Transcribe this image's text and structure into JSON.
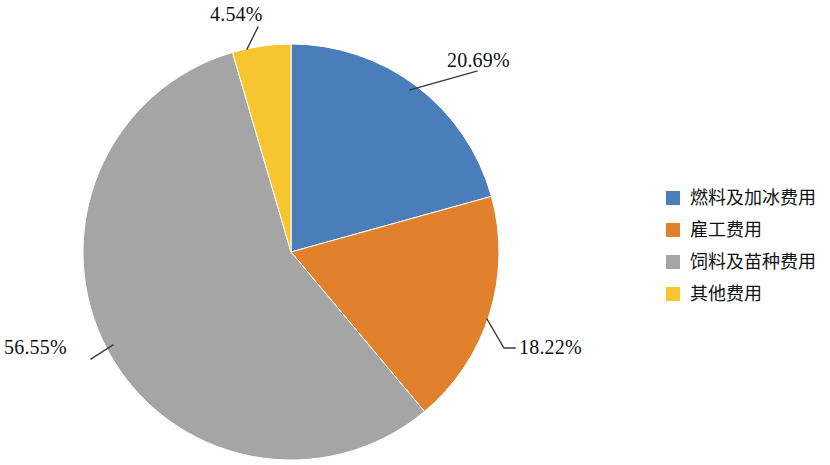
{
  "chart_data": {
    "type": "pie",
    "title": "",
    "subtitle": "",
    "xlabel": "",
    "ylabel": "",
    "grid": false,
    "legend_position": "right",
    "start_angle_deg": 0,
    "direction": "clockwise",
    "categories": [
      "燃料及加冰费用",
      "雇工费用",
      "饲料及苗种费用",
      "其他费用"
    ],
    "values": [
      20.69,
      18.22,
      56.55,
      4.54
    ],
    "value_unit": "%",
    "data_labels": [
      "20.69%",
      "18.22%",
      "56.55%",
      "4.54%"
    ],
    "colors": [
      "#4A7EBB",
      "#E2812B",
      "#A5A5A5",
      "#F7C530"
    ],
    "series": [
      {
        "name": "费用构成",
        "values": [
          20.69,
          18.22,
          56.55,
          4.54
        ]
      }
    ],
    "slices": [
      {
        "label": "燃料及加冰费用",
        "value": 20.69,
        "data_label": "20.69%",
        "color": "#4A7EBB"
      },
      {
        "label": "雇工费用",
        "value": 18.22,
        "data_label": "18.22%",
        "color": "#E2812B"
      },
      {
        "label": "饲料及苗种费用",
        "value": 56.55,
        "data_label": "56.55%",
        "color": "#A5A5A5"
      },
      {
        "label": "其他费用",
        "value": 4.54,
        "data_label": "4.54%",
        "color": "#F7C530"
      }
    ]
  },
  "labels": {
    "fuel_ice_pct": "20.69%",
    "labor_pct": "18.22%",
    "feed_seed_pct": "56.55%",
    "other_pct": "4.54%"
  },
  "legend": {
    "items": [
      {
        "label": "燃料及加冰费用",
        "color": "#4A7EBB"
      },
      {
        "label": "雇工费用",
        "color": "#E2812B"
      },
      {
        "label": "饲料及苗种费用",
        "color": "#A5A5A5"
      },
      {
        "label": "其他费用",
        "color": "#F7C530"
      }
    ]
  },
  "theme": {
    "background": "#FFFFFF",
    "text": "#111111",
    "leader_line": "#3A3A3A"
  }
}
